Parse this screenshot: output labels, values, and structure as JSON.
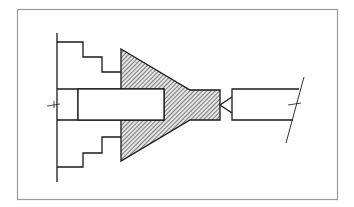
{
  "figure": {
    "title": "",
    "colors": {
      "background": "#ffffff",
      "frame": "#9a9a9a",
      "line": "#1a1a1a",
      "hatch": "#333333"
    },
    "components": [
      {
        "id": "frame",
        "label": "drawing-border"
      },
      {
        "id": "chuck-jaws",
        "label": "stepped-jaws"
      },
      {
        "id": "workpiece",
        "label": "hatched-workpiece"
      },
      {
        "id": "bore",
        "label": "inner-bore"
      },
      {
        "id": "center-point",
        "label": "live-center-cone"
      },
      {
        "id": "shaft",
        "label": "tailstock-shaft"
      },
      {
        "id": "break-line",
        "label": "break-line"
      }
    ]
  }
}
